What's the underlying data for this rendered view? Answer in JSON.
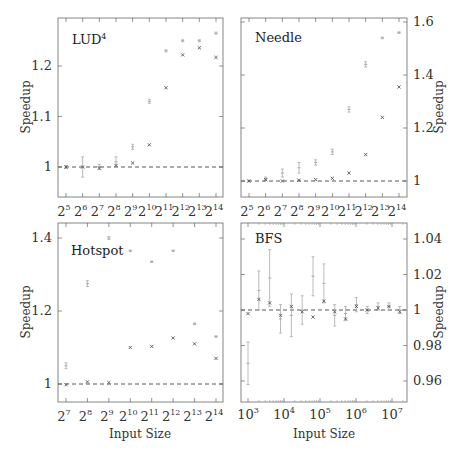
{
  "chart_data": [
    {
      "type": "scatter",
      "title": "LUD⁴",
      "xlabel": "",
      "ylabel": "Speedup",
      "categories": [
        "2^5",
        "2^6",
        "2^7",
        "2^8",
        "2^9",
        "2^10",
        "2^11",
        "2^12",
        "2^13",
        "2^14"
      ],
      "ylim": [
        0.94,
        1.27
      ],
      "yticks": [
        1,
        1.1,
        1.2
      ],
      "ytick_side": "left",
      "reference_line": 1,
      "series": [
        {
          "name": "light (error bars)",
          "values": [
            1.0,
            1.0,
            1.0,
            1.01,
            1.04,
            1.13,
            1.23,
            1.25,
            1.25,
            1.265
          ],
          "err": [
            0.003,
            0.02,
            0.005,
            0.01,
            0.005,
            0.004,
            0.002,
            0.002,
            0.002,
            0.002
          ]
        },
        {
          "name": "dark (x markers)",
          "values": [
            1.0,
            1.0,
            0.998,
            1.003,
            1.008,
            1.044,
            1.157,
            1.222,
            1.236,
            1.217
          ]
        }
      ]
    },
    {
      "type": "scatter",
      "title": "Needle",
      "xlabel": "",
      "ylabel": "Speedup",
      "categories": [
        "2^5",
        "2^6",
        "2^7",
        "2^8",
        "2^9",
        "2^10",
        "2^11",
        "2^12",
        "2^13",
        "2^14"
      ],
      "ylim": [
        0.95,
        1.61
      ],
      "yticks": [
        1,
        1.2,
        1.4,
        1.6
      ],
      "ytick_side": "right",
      "reference_line": 1,
      "series": [
        {
          "name": "light (error bars)",
          "values": [
            1.0,
            1.01,
            1.03,
            1.05,
            1.07,
            1.11,
            1.27,
            1.44,
            1.54,
            1.56
          ],
          "err": [
            0.003,
            0.005,
            0.015,
            0.02,
            0.01,
            0.01,
            0.01,
            0.01,
            0.003,
            0.003
          ]
        },
        {
          "name": "dark (x markers)",
          "values": [
            1.0,
            1.005,
            1.0,
            1.003,
            1.005,
            1.01,
            1.03,
            1.1,
            1.24,
            1.355
          ]
        }
      ]
    },
    {
      "type": "scatter",
      "title": "Hotspot",
      "xlabel": "Input Size",
      "ylabel": "Speedup",
      "categories": [
        "2^7",
        "2^8",
        "2^9",
        "2^10",
        "2^11",
        "2^12",
        "2^13",
        "2^14"
      ],
      "ylim": [
        0.955,
        1.44
      ],
      "yticks": [
        1,
        1.2,
        1.4
      ],
      "ytick_side": "left",
      "reference_line": 1,
      "series": [
        {
          "name": "light (error bars)",
          "values": [
            1.05,
            1.275,
            1.4,
            1.365,
            1.335,
            1.365,
            1.165,
            1.13
          ],
          "err": [
            0.008,
            0.008,
            0.004,
            0.002,
            0.002,
            0.002,
            0.002,
            0.002
          ]
        },
        {
          "name": "dark (x markers)",
          "values": [
            0.998,
            1.006,
            1.004,
            1.1,
            1.103,
            1.126,
            1.11,
            1.07
          ]
        }
      ]
    },
    {
      "type": "scatter",
      "title": "BFS",
      "xlabel": "Input Size",
      "ylabel": "Speedup",
      "xscale": "log",
      "xticks": [
        "10^3",
        "10^4",
        "10^5",
        "10^6",
        "10^7"
      ],
      "x": [
        1000,
        2000,
        4000,
        8000,
        16000,
        32000,
        64000,
        128000,
        256000,
        512000,
        1024000,
        2048000,
        4096000,
        8192000,
        16384000
      ],
      "ylim": [
        0.95,
        1.05
      ],
      "yticks": [
        0.96,
        0.98,
        1,
        1.02,
        1.04
      ],
      "ytick_side": "right",
      "reference_line": 1,
      "series": [
        {
          "name": "light (error bars)",
          "values": [
            0.97,
            1.011,
            1.018,
            0.995,
            0.997,
            1.0,
            1.019,
            1.015,
            0.997,
            0.998,
            1.003,
            1.0,
            1.002,
            1.002,
            1.0
          ],
          "err": [
            0.012,
            0.011,
            0.016,
            0.008,
            0.012,
            0.008,
            0.011,
            0.011,
            0.006,
            0.004,
            0.004,
            0.002,
            0.002,
            0.002,
            0.002
          ]
        },
        {
          "name": "dark (x markers)",
          "values": [
            0.998,
            1.006,
            1.004,
            0.997,
            1.002,
            0.999,
            0.996,
            1.005,
            0.999,
            0.995,
            1.002,
            1.0,
            1.001,
            1.002,
            0.999
          ]
        }
      ]
    }
  ],
  "labels": {
    "lud_title": "LUD",
    "lud_sup": "4",
    "needle_title": "Needle",
    "hotspot_title": "Hotspot",
    "bfs_title": "BFS",
    "ylabel": "Speedup",
    "xlabel": "Input Size",
    "lud_yticks": [
      "1",
      "1.1",
      "1.2"
    ],
    "needle_yticks": [
      "1",
      "1.2",
      "1.4",
      "1.6"
    ],
    "hotspot_yticks": [
      "1",
      "1.2",
      "1.4"
    ],
    "bfs_yticks": [
      "0.96",
      "0.98",
      "1",
      "1.02",
      "1.04"
    ],
    "pow2_bases": [
      "2",
      "2",
      "2",
      "2",
      "2",
      "2",
      "2",
      "2",
      "2",
      "2"
    ],
    "lud_exps": [
      "5",
      "6",
      "7",
      "8",
      "9",
      "10",
      "11",
      "12",
      "13",
      "14"
    ],
    "hotspot_exps": [
      "7",
      "8",
      "9",
      "10",
      "11",
      "12",
      "13",
      "14"
    ],
    "bfs_exps": [
      "3",
      "4",
      "5",
      "6",
      "7"
    ]
  }
}
